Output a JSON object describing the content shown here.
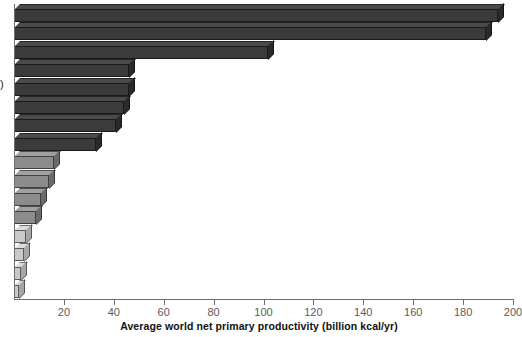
{
  "axis": {
    "ylabel_clip": ")",
    "xlabel": "Average world net primary productivity (billion kcal/yr)",
    "ticks": [
      {
        "value": 0,
        "label": ""
      },
      {
        "value": 20,
        "label": "20"
      },
      {
        "value": 40,
        "label": "40"
      },
      {
        "value": 60,
        "label": "60"
      },
      {
        "value": 80,
        "label": "80"
      },
      {
        "value": 100,
        "label": "100"
      },
      {
        "value": 120,
        "label": "120"
      },
      {
        "value": 140,
        "label": "140"
      },
      {
        "value": 160,
        "label": "160"
      },
      {
        "value": 180,
        "label": "180"
      },
      {
        "value": 200,
        "label": "200"
      }
    ]
  },
  "colors": {
    "bar_dark": "#3b3b3b",
    "bar_dark_top": "#4a4a4a",
    "bar_dark_side": "#2a2a2a",
    "bar_mid": "#8c8c8c",
    "bar_mid_top": "#a0a0a0",
    "bar_mid_side": "#6b6b6b",
    "bar_light": "#c9c9c9",
    "bar_light_top": "#dcdcdc",
    "bar_light_side": "#a6a6a6",
    "axis": "#6e6e6e",
    "tick_text": "#5b5b5b",
    "title_text": "#111111",
    "background": "#ffffff"
  },
  "chart_data": {
    "type": "bar",
    "orientation": "horizontal",
    "title": "",
    "subtitle": "",
    "xlabel": "Average world net primary productivity (billion kcal/yr)",
    "ylabel": ")",
    "xlim": [
      0,
      200
    ],
    "grid": false,
    "legend": "none",
    "xtick_step": 20,
    "series": [
      {
        "name": "Average world net primary productivity (billion kcal/yr)",
        "values": [
          194,
          189,
          102,
          46,
          46,
          44,
          41,
          33,
          16,
          14,
          11,
          9,
          5,
          4,
          3,
          2
        ]
      }
    ],
    "categories": [
      "",
      "",
      "",
      "",
      "",
      "",
      "",
      "",
      "",
      "",
      "",
      "",
      "",
      "",
      "",
      ""
    ],
    "bars": [
      {
        "index": 1,
        "value": 194,
        "tone": "dark"
      },
      {
        "index": 2,
        "value": 189,
        "tone": "dark"
      },
      {
        "index": 3,
        "value": 102,
        "tone": "dark"
      },
      {
        "index": 4,
        "value": 46,
        "tone": "dark"
      },
      {
        "index": 5,
        "value": 46,
        "tone": "dark"
      },
      {
        "index": 6,
        "value": 44,
        "tone": "dark"
      },
      {
        "index": 7,
        "value": 41,
        "tone": "dark"
      },
      {
        "index": 8,
        "value": 33,
        "tone": "dark"
      },
      {
        "index": 9,
        "value": 16,
        "tone": "mid"
      },
      {
        "index": 10,
        "value": 14,
        "tone": "mid"
      },
      {
        "index": 11,
        "value": 11,
        "tone": "mid"
      },
      {
        "index": 12,
        "value": 9,
        "tone": "mid"
      },
      {
        "index": 13,
        "value": 5,
        "tone": "light"
      },
      {
        "index": 14,
        "value": 4,
        "tone": "light"
      },
      {
        "index": 15,
        "value": 3,
        "tone": "light"
      },
      {
        "index": 16,
        "value": 2,
        "tone": "light"
      }
    ]
  }
}
